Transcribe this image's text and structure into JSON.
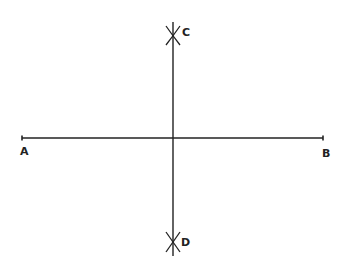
{
  "diagram": {
    "points": {
      "A": {
        "label": "A"
      },
      "B": {
        "label": "B"
      },
      "C": {
        "label": "C"
      },
      "D": {
        "label": "D"
      }
    },
    "colors": {
      "stroke": "#222222",
      "background": "#ffffff"
    }
  }
}
